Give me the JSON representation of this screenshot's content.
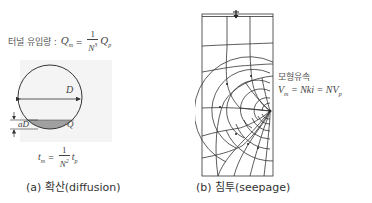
{
  "panel_a": {
    "inflow_label": "터널 유입량 :",
    "inflow_lhs": "Q",
    "inflow_lhs_sub": "m",
    "inflow_eq": "=",
    "inflow_num": "1",
    "inflow_den": "N",
    "inflow_den_sup": "3",
    "inflow_rhs": "Q",
    "inflow_rhs_sub": "p",
    "diameter_label": "D",
    "depth_label": "aD",
    "flow_label": "Q",
    "time_lhs": "t",
    "time_lhs_sub": "m",
    "time_eq": "=",
    "time_num": "1",
    "time_den": "N",
    "time_den_sup": "2",
    "time_rhs": "t",
    "time_rhs_sub": "p",
    "caption": "(a) 확산(diffusion)"
  },
  "panel_b": {
    "velocity_title": "모형유속",
    "vel_lhs": "V",
    "vel_lhs_sub": "m",
    "vel_mid": "= Nki = NV",
    "vel_rhs_sub": "p",
    "caption": "(b) 침투(seepage)"
  },
  "colors": {
    "line": "#333333",
    "shade": "#a0a0a0",
    "panel_bg": "#f4f4f4"
  }
}
